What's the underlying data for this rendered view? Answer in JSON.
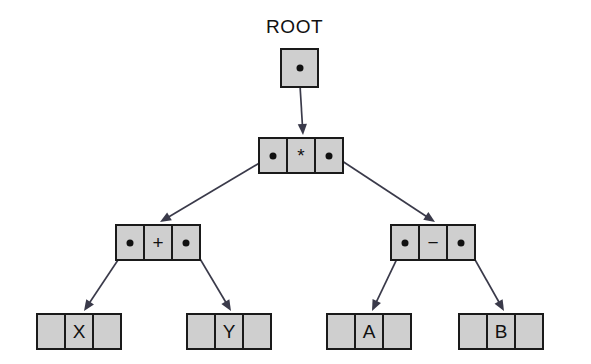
{
  "diagram": {
    "title_label": "ROOT",
    "colors": {
      "node_fill": "#cfcfcf",
      "node_border": "#1a1a1a",
      "pointer_dot": "#111111",
      "edge": "#3a3a4a",
      "background": "#ffffff"
    },
    "nodes": [
      {
        "id": "root",
        "name": "root-pointer-node",
        "kind": "root-pointer",
        "label": "",
        "cells": [
          "pointer"
        ],
        "x": 280,
        "y": 48,
        "w": 39,
        "h": 40,
        "cell_w": 39
      },
      {
        "id": "mul",
        "name": "operator-node-multiply",
        "kind": "internal",
        "label": "*",
        "cells": [
          "pointer",
          "value",
          "pointer"
        ],
        "x": 258,
        "y": 137,
        "w": 90,
        "h": 37,
        "cell_w": 30
      },
      {
        "id": "plus",
        "name": "operator-node-plus",
        "kind": "internal",
        "label": "+",
        "cells": [
          "pointer",
          "value",
          "pointer"
        ],
        "x": 115,
        "y": 224,
        "w": 90,
        "h": 37,
        "cell_w": 30
      },
      {
        "id": "minus",
        "name": "operator-node-minus",
        "kind": "internal",
        "label": "−",
        "cells": [
          "pointer",
          "value",
          "pointer"
        ],
        "x": 390,
        "y": 224,
        "w": 90,
        "h": 37,
        "cell_w": 30
      },
      {
        "id": "leafX",
        "name": "leaf-node-x",
        "kind": "leaf",
        "label": "X",
        "cells": [
          "null",
          "value",
          "null"
        ],
        "x": 36,
        "y": 313,
        "w": 90,
        "h": 37,
        "cell_w": 30
      },
      {
        "id": "leafY",
        "name": "leaf-node-y",
        "kind": "leaf",
        "label": "Y",
        "cells": [
          "null",
          "value",
          "null"
        ],
        "x": 186,
        "y": 313,
        "w": 90,
        "h": 37,
        "cell_w": 30
      },
      {
        "id": "leafA",
        "name": "leaf-node-a",
        "kind": "leaf",
        "label": "A",
        "cells": [
          "null",
          "value",
          "null"
        ],
        "x": 326,
        "y": 313,
        "w": 90,
        "h": 37,
        "cell_w": 30
      },
      {
        "id": "leafB",
        "name": "leaf-node-b",
        "kind": "leaf",
        "label": "B",
        "cells": [
          "null",
          "value",
          "null"
        ],
        "x": 458,
        "y": 313,
        "w": 90,
        "h": 37,
        "cell_w": 30
      }
    ],
    "edges": [
      {
        "name": "edge-root-to-multiply",
        "from": "root",
        "to": "mul",
        "x1": 299,
        "y1": 68,
        "x2": 303,
        "y2": 135
      },
      {
        "name": "edge-multiply-to-plus",
        "from": "mul",
        "to": "plus",
        "x1": 273,
        "y1": 155,
        "x2": 160,
        "y2": 222
      },
      {
        "name": "edge-multiply-to-minus",
        "from": "mul",
        "to": "minus",
        "x1": 333,
        "y1": 155,
        "x2": 435,
        "y2": 222
      },
      {
        "name": "edge-plus-to-x",
        "from": "plus",
        "to": "leafX",
        "x1": 130,
        "y1": 242,
        "x2": 84,
        "y2": 311
      },
      {
        "name": "edge-plus-to-y",
        "from": "plus",
        "to": "leafY",
        "x1": 190,
        "y1": 242,
        "x2": 231,
        "y2": 311
      },
      {
        "name": "edge-minus-to-a",
        "from": "minus",
        "to": "leafA",
        "x1": 405,
        "y1": 242,
        "x2": 372,
        "y2": 311
      },
      {
        "name": "edge-minus-to-b",
        "from": "minus",
        "to": "leafB",
        "x1": 465,
        "y1": 242,
        "x2": 504,
        "y2": 311
      }
    ],
    "root_label_pos": {
      "x": 266,
      "y": 16
    },
    "expression": "(X + Y) * (A − B)"
  }
}
